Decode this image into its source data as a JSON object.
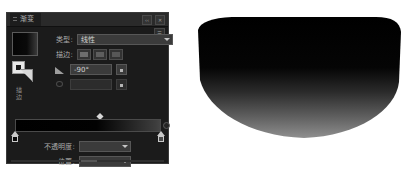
{
  "panel": {
    "tab_label": "渐变",
    "collapse_icon": "chevron-double-icon",
    "close_icon": "close-icon",
    "menu_icon": "panel-menu-icon",
    "swatch_name": "gradient-preview-swatch",
    "fill_stroke_label": "描边",
    "rows": {
      "type": {
        "label": "类型:",
        "value": "线性",
        "caret_icon": "chevron-down-icon"
      },
      "stroke": {
        "label": "描边:",
        "buttons": [
          "stroke-within-icon",
          "stroke-along-icon",
          "stroke-across-icon"
        ]
      },
      "angle": {
        "icon": "angle-icon",
        "label": "",
        "value": "-90°",
        "reverse_icon": "reverse-gradient-icon"
      },
      "aspect": {
        "icon": "aspect-ratio-icon",
        "label": "",
        "value": "",
        "disabled": true
      },
      "opacity": {
        "label": "不透明度:",
        "value": "",
        "caret_icon": "chevron-down-icon"
      },
      "location": {
        "label": "位置:",
        "value": "",
        "caret_icon": "chevron-down-icon"
      }
    },
    "slider": {
      "name": "gradient-slider",
      "midpoint_position": "58",
      "start_stop_color": "#000000",
      "end_stop_color": "#4a4a4a",
      "bar_gradient": "black-to-gray"
    }
  },
  "artwork": {
    "name": "gradient-filled-bowl-shape",
    "gradient_from": "#000000",
    "gradient_to": "#8a8a8a",
    "direction": "top-to-bottom"
  },
  "colors": {
    "panel_bg": "#1b1b1b",
    "panel_header": "#2a2a2a",
    "field_bg": "#3b3b3b",
    "text": "#a9a9a9",
    "canvas": "#ffffff"
  }
}
